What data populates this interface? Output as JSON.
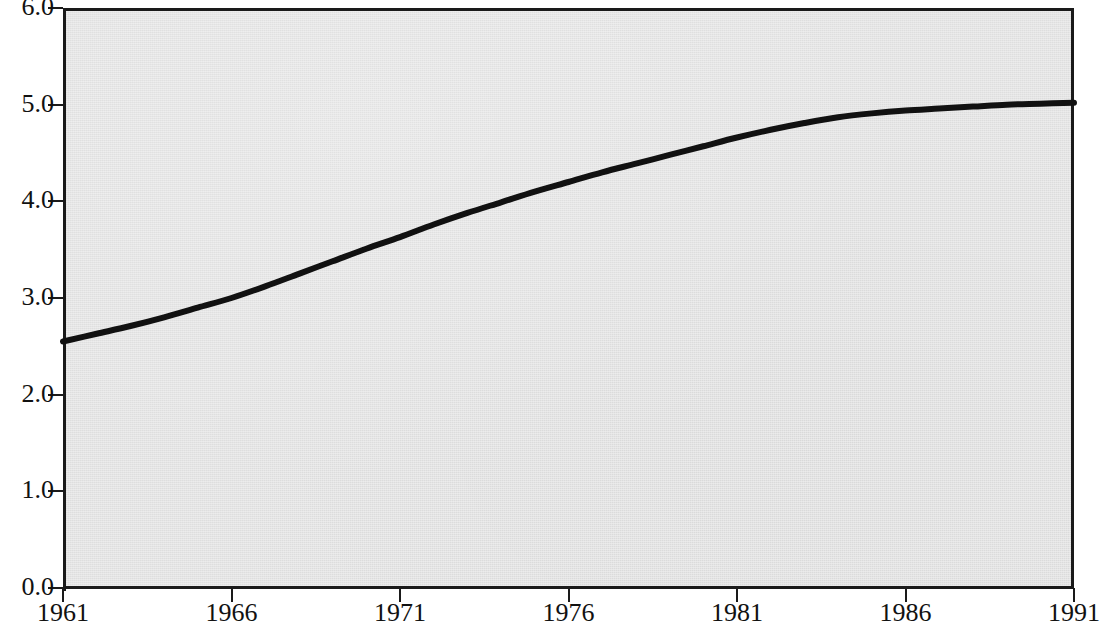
{
  "chart_data": {
    "type": "line",
    "title": "",
    "subtitle": "",
    "xlabel": "",
    "ylabel": "",
    "x": [
      1961,
      1962,
      1963,
      1964,
      1965,
      1966,
      1967,
      1968,
      1969,
      1970,
      1971,
      1972,
      1973,
      1974,
      1975,
      1976,
      1977,
      1978,
      1979,
      1980,
      1981,
      1982,
      1983,
      1984,
      1985,
      1986,
      1987,
      1988,
      1989,
      1990,
      1991
    ],
    "values": [
      2.55,
      2.63,
      2.71,
      2.8,
      2.9,
      3.0,
      3.12,
      3.25,
      3.38,
      3.51,
      3.63,
      3.76,
      3.88,
      3.99,
      4.1,
      4.2,
      4.3,
      4.39,
      4.48,
      4.57,
      4.66,
      4.74,
      4.81,
      4.87,
      4.91,
      4.94,
      4.96,
      4.98,
      5.0,
      5.01,
      5.02
    ],
    "series": [
      {
        "name": "series-1",
        "values": [
          2.55,
          2.63,
          2.71,
          2.8,
          2.9,
          3.0,
          3.12,
          3.25,
          3.38,
          3.51,
          3.63,
          3.76,
          3.88,
          3.99,
          4.1,
          4.2,
          4.3,
          4.39,
          4.48,
          4.57,
          4.66,
          4.74,
          4.81,
          4.87,
          4.91,
          4.94,
          4.96,
          4.98,
          5.0,
          5.01,
          5.02
        ],
        "color": "#111111",
        "line_width": 6
      }
    ],
    "xlim": [
      1961,
      1991
    ],
    "ylim": [
      0.0,
      6.0
    ],
    "xticks": [
      1961,
      1966,
      1971,
      1976,
      1981,
      1986,
      1991
    ],
    "xtick_labels": [
      "1961",
      "1966",
      "1971",
      "1976",
      "1981",
      "1986",
      "1991"
    ],
    "yticks": [
      0.0,
      1.0,
      2.0,
      3.0,
      4.0,
      5.0,
      6.0
    ],
    "ytick_labels": [
      "0.0",
      "1.0",
      "2.0",
      "3.0",
      "4.0",
      "5.0",
      "6.0"
    ],
    "grid": false,
    "legend": false,
    "legend_position": "none",
    "annotations": [],
    "plot_background_color": "#e3e3e3",
    "axis_color": "#1a1a1a",
    "page_background_color": "#ffffff"
  }
}
